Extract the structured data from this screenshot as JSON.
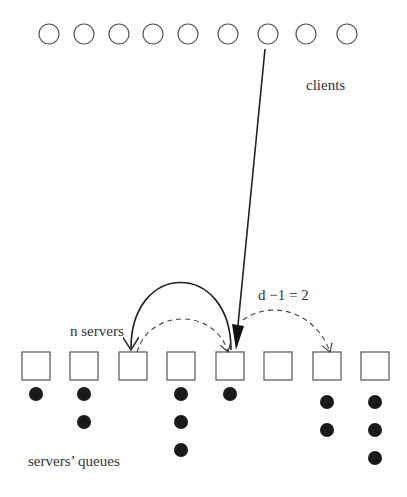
{
  "labels": {
    "clients": "clients",
    "n_servers": "n servers",
    "d_minus_1": "d −1 = 2",
    "queues": "servers’ queues"
  },
  "clients": [
    {
      "cx": 49,
      "cy": 34
    },
    {
      "cx": 84,
      "cy": 34
    },
    {
      "cx": 119,
      "cy": 34
    },
    {
      "cx": 153,
      "cy": 34
    },
    {
      "cx": 188,
      "cy": 34
    },
    {
      "cx": 228,
      "cy": 34
    },
    {
      "cx": 268,
      "cy": 34
    },
    {
      "cx": 306,
      "cy": 34
    },
    {
      "cx": 347,
      "cy": 34
    }
  ],
  "servers": [
    {
      "x": 22,
      "queue": 1
    },
    {
      "x": 70,
      "queue": 2
    },
    {
      "x": 119,
      "queue": 0
    },
    {
      "x": 167,
      "queue": 3
    },
    {
      "x": 216,
      "queue": 1
    },
    {
      "x": 264,
      "queue": 0
    },
    {
      "x": 313,
      "queue": 2
    },
    {
      "x": 361,
      "queue": 3
    }
  ],
  "colors": {
    "stroke": "#555555",
    "dot": "#1a1a1a",
    "text": "#333333"
  }
}
